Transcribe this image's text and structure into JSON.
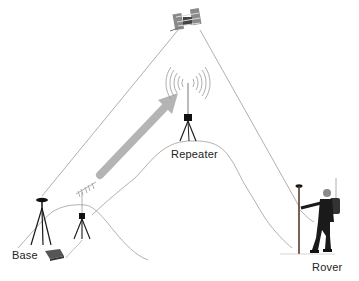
{
  "diagram": {
    "labels": {
      "base": "Base",
      "repeater": "Repeater",
      "rover": "Rover"
    },
    "nodes": [
      {
        "id": "satellite",
        "icon": "satellite-icon",
        "x": 188,
        "y": 22
      },
      {
        "id": "repeater",
        "icon": "tripod-antenna-icon",
        "x": 188,
        "y": 118
      },
      {
        "id": "base",
        "icon": "tripod-icon",
        "x": 42,
        "y": 200
      },
      {
        "id": "radio",
        "icon": "yagi-antenna-tripod-icon",
        "x": 82,
        "y": 215
      },
      {
        "id": "radio-box",
        "icon": "radio-box-icon",
        "x": 52,
        "y": 253
      },
      {
        "id": "rover",
        "icon": "surveyor-person-icon",
        "x": 305,
        "y": 210
      }
    ],
    "connections": [
      {
        "from": "satellite",
        "to": "base",
        "style": "thin-line"
      },
      {
        "from": "satellite",
        "to": "rover",
        "style": "thin-line"
      },
      {
        "from": "radio",
        "to": "repeater",
        "style": "thick-gray-arrow"
      }
    ],
    "colors": {
      "line": "#9a9a9a",
      "arrow": "#b4b4b4",
      "equipment": "#1a1a1a",
      "terrain": "#a8a8a8"
    }
  }
}
